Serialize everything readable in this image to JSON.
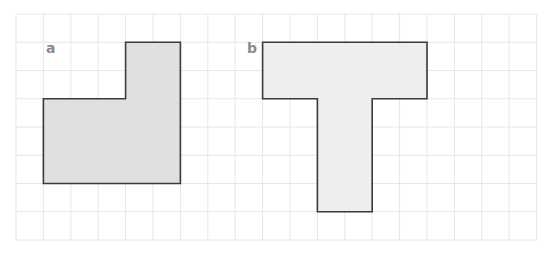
{
  "figure": {
    "grid": {
      "origin_x": 16,
      "origin_y": 14,
      "cell_w": 27.4,
      "cell_h": 28.25,
      "cols": 19,
      "rows": 8,
      "line_color": "#e6e6e6"
    },
    "shapes": [
      {
        "id": "a",
        "label": "a",
        "label_pos": {
          "x": 46,
          "y": 41
        },
        "fill": "#e0e0e0",
        "stroke": "#3a3a3a",
        "vertices_grid": [
          [
            4,
            1
          ],
          [
            6,
            1
          ],
          [
            6,
            6
          ],
          [
            1,
            6
          ],
          [
            1,
            3
          ],
          [
            4,
            3
          ]
        ]
      },
      {
        "id": "b",
        "label": "b",
        "label_pos": {
          "x": 247,
          "y": 41
        },
        "fill": "#eeeeee",
        "stroke": "#3a3a3a",
        "vertices_grid": [
          [
            9,
            1
          ],
          [
            15,
            1
          ],
          [
            15,
            3
          ],
          [
            13,
            3
          ],
          [
            13,
            7
          ],
          [
            11,
            7
          ],
          [
            11,
            3
          ],
          [
            9,
            3
          ]
        ]
      }
    ]
  }
}
